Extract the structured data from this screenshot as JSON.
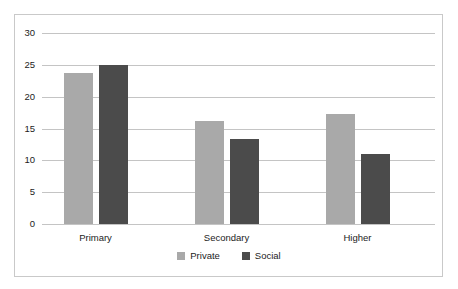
{
  "chart_data": {
    "type": "bar",
    "title": "",
    "xlabel": "",
    "ylabel": "",
    "categories": [
      "Primary",
      "Secondary",
      "Higher"
    ],
    "series": [
      {
        "name": "Private",
        "color": "#a9a9a9",
        "values": [
          23.7,
          16.2,
          17.3
        ]
      },
      {
        "name": "Social",
        "color": "#4b4b4b",
        "values": [
          25.0,
          13.4,
          11.0
        ]
      }
    ],
    "ylim": [
      0,
      30
    ],
    "yticks": [
      0,
      5,
      10,
      15,
      20,
      25,
      30
    ],
    "ytick_labels": [
      "0",
      "5",
      "10",
      "15",
      "20",
      "25",
      "30"
    ],
    "grid": true,
    "grid_axis": "y",
    "legend": [
      "Private",
      "Social"
    ],
    "legend_position": "bottom-center",
    "frame_border_color": "#c9c9c9",
    "gridline_color": "#c4c4c4",
    "background_color": "#ffffff"
  }
}
